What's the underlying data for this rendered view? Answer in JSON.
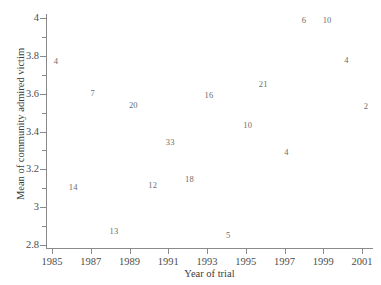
{
  "chart_data": {
    "type": "scatter",
    "title": "",
    "xlabel": "Year of trial",
    "ylabel": "Mean of community admired victim",
    "xlim": [
      1984.25,
      2001.8
    ],
    "ylim": [
      2.76,
      4.06
    ],
    "grid": false,
    "legend": null,
    "point_marker": "value-label",
    "note": "Each plotted point is rendered as its numeric sample-size label rather than a marker glyph.",
    "x_ticks": [
      1985,
      1987,
      1989,
      1991,
      1993,
      1995,
      1997,
      1999,
      2001
    ],
    "x_tick_labels": [
      "1985",
      "1987",
      "1989",
      "1991",
      "1993",
      "1995",
      "1997",
      "1999",
      "2001"
    ],
    "y_ticks": [
      2.8,
      3.0,
      3.2,
      3.4,
      3.6,
      3.8,
      4.0
    ],
    "y_tick_labels": [
      "2.8",
      "3",
      "3.2",
      "3.4",
      "3.6",
      "3.8",
      "4"
    ],
    "y_minor_ticks": [
      2.9,
      3.1,
      3.3,
      3.5,
      3.7,
      3.9
    ],
    "points": [
      {
        "label": "4",
        "x": 1985.2,
        "y": 3.772
      },
      {
        "label": "7",
        "x": 1987.1,
        "y": 3.603
      },
      {
        "label": "20",
        "x": 1989.2,
        "y": 3.54
      },
      {
        "label": "14",
        "x": 1986.1,
        "y": 3.108
      },
      {
        "label": "13",
        "x": 1988.2,
        "y": 2.872
      },
      {
        "label": "12",
        "x": 1990.2,
        "y": 3.119
      },
      {
        "label": "33",
        "x": 1991.1,
        "y": 3.344
      },
      {
        "label": "18",
        "x": 1992.1,
        "y": 3.151
      },
      {
        "label": "16",
        "x": 1993.1,
        "y": 3.592
      },
      {
        "label": "5",
        "x": 1994.1,
        "y": 2.852
      },
      {
        "label": "10",
        "x": 1995.1,
        "y": 3.434
      },
      {
        "label": "21",
        "x": 1995.9,
        "y": 3.651
      },
      {
        "label": "4",
        "x": 1997.1,
        "y": 3.291
      },
      {
        "label": "6",
        "x": 1998.0,
        "y": 3.99
      },
      {
        "label": "10",
        "x": 1999.2,
        "y": 3.99
      },
      {
        "label": "4",
        "x": 2000.2,
        "y": 3.778
      },
      {
        "label": "2",
        "x": 2001.2,
        "y": 3.534
      }
    ],
    "colors": {
      "axis": "#8a8a8a",
      "tick_label": "#4d4d4d",
      "axis_title": "#3d3d3d",
      "point_label": "#6b6b6b",
      "background": "#ffffff"
    }
  }
}
